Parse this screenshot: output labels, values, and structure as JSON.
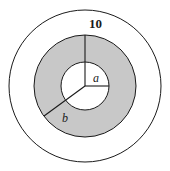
{
  "figure": {
    "background_color": "#ffffff",
    "stroke_color": "#1a1a1a",
    "shaded_fill_color": "#c8c8c8",
    "unshaded_fill_color": "#ffffff",
    "center": {
      "x": 85,
      "y": 86
    },
    "circles": [
      {
        "name": "outer-circle",
        "radius": 76,
        "fill": "#ffffff"
      },
      {
        "name": "annulus-outer-circle",
        "radius": 51,
        "fill": "#c8c8c8"
      },
      {
        "name": "inner-circle",
        "radius": 24,
        "fill": "#ffffff"
      }
    ],
    "radii": [
      {
        "name": "radius-10",
        "label": "10",
        "angle_degrees": 90,
        "length": 51,
        "endpoint": {
          "x": 85,
          "y": 35
        }
      },
      {
        "name": "radius-a",
        "label": "a",
        "angle_degrees": 0,
        "length": 24,
        "endpoint": {
          "x": 109,
          "y": 86
        }
      },
      {
        "name": "radius-b",
        "label": "b",
        "angle_degrees": 216,
        "length": 51,
        "endpoint": {
          "x": 44,
          "y": 116
        }
      }
    ],
    "labels": {
      "ten": "10",
      "a": "a",
      "b": "b"
    }
  },
  "chart_data": {
    "type": "diagram",
    "shapes": [
      {
        "shape": "circle",
        "role": "outer boundary",
        "radius_px": 76,
        "fill": "white",
        "stroke": "black"
      },
      {
        "shape": "circle",
        "role": "annulus outer boundary",
        "radius_px": 51,
        "fill": "gray",
        "stroke": "black",
        "label": "b"
      },
      {
        "shape": "circle",
        "role": "annulus inner boundary",
        "radius_px": 24,
        "fill": "white",
        "stroke": "black",
        "label": "a"
      }
    ],
    "annotations": [
      {
        "text": "10",
        "describes": "distance from annulus outer edge upward",
        "position": "top"
      },
      {
        "text": "a",
        "describes": "radius of inner white circle",
        "position": "center-right"
      },
      {
        "text": "b",
        "describes": "radius of gray annulus outer edge",
        "position": "lower-left"
      }
    ]
  }
}
